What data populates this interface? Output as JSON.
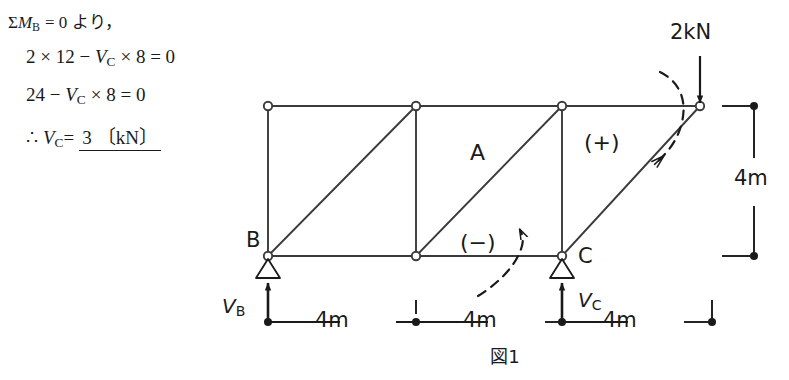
{
  "solution": {
    "line1": {
      "sigma": "Σ",
      "m": "M",
      "m_sub": "B",
      "rest": "= 0 より，"
    },
    "line2": {
      "text": "2 × 12 − ",
      "v": "V",
      "v_sub": "C",
      "tail": "× 8 = 0"
    },
    "line3": {
      "text": "24 − ",
      "v": "V",
      "v_sub": "C",
      "tail": "× 8 = 0"
    },
    "line4": {
      "therefore": "∴",
      "v": "V",
      "v_sub": "C",
      "eq": "=",
      "answer": "3",
      "unit": "〔kN〕"
    }
  },
  "figure": {
    "caption": "図1",
    "load": {
      "label": "2kN",
      "direction": "down"
    },
    "supports": [
      {
        "name": "B",
        "label": "B",
        "reaction_label": "V",
        "reaction_sub": "B",
        "type": "pin-triangle"
      },
      {
        "name": "C",
        "label": "C",
        "reaction_label": "V",
        "reaction_sub": "C",
        "type": "pin-triangle"
      }
    ],
    "member_label": "A",
    "sign_minus": "(−)",
    "sign_plus": "(+)",
    "dimensions": {
      "horizontal": [
        "4m",
        "4m",
        "4m"
      ],
      "vertical": "4m"
    },
    "nodes_top": [
      {
        "x": 268,
        "y": 106
      },
      {
        "x": 416,
        "y": 106
      },
      {
        "x": 562,
        "y": 106
      },
      {
        "x": 700,
        "y": 106
      }
    ],
    "nodes_bottom": [
      {
        "x": 268,
        "y": 256
      },
      {
        "x": 416,
        "y": 256
      },
      {
        "x": 562,
        "y": 256
      }
    ]
  },
  "colors": {
    "ink": "#1a1a1a",
    "line": "#3a3a3a",
    "background": "#ffffff"
  }
}
